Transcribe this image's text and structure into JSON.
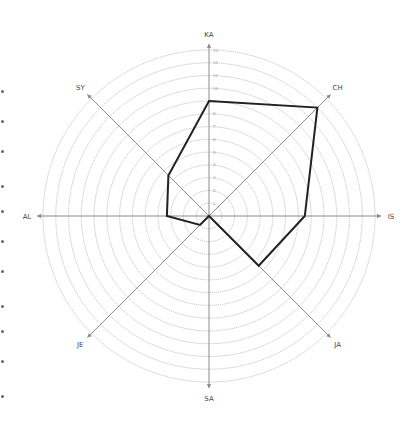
{
  "chart_data": {
    "type": "radar",
    "title": "",
    "axes": [
      "KA",
      "CH",
      "IS",
      "JA",
      "SA",
      "JE",
      "AL",
      "SY"
    ],
    "series": [
      {
        "name": "",
        "values": [
          9,
          12,
          7.5,
          5.5,
          0,
          1,
          3.3,
          4.5
        ],
        "color": "#222222"
      }
    ],
    "rlim": [
      0,
      13
    ],
    "rings": 13,
    "tick_labels": [
      "1",
      "2",
      "3",
      "4",
      "5",
      "6",
      "7",
      "8",
      "9",
      "10",
      "11",
      "12",
      "13"
    ],
    "grid": true,
    "legend": false
  },
  "style": {
    "grid_color": "#b5b5b5",
    "axis_color": "#8a8a8a",
    "line_color": "#222222"
  }
}
